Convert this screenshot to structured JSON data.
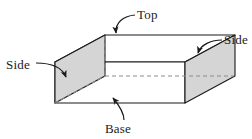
{
  "figure": {
    "shape": "rectangular prism (box)",
    "projection": "oblique",
    "colors": {
      "stroke": "#1a1a1a",
      "side_face_fill": "#d5d5d5",
      "front_face_fill": "#ffffff",
      "top_face_fill": "#ffffff",
      "hidden_edge": "#8c8c8c",
      "background": "#ffffff",
      "label_text": "#1a1a1a"
    },
    "labels": {
      "top": "Top",
      "side_left": "Side",
      "side_right": "Side",
      "base": "Base"
    },
    "annotations": [
      {
        "name": "top",
        "text": "Top",
        "points_to": "top face"
      },
      {
        "name": "side-left",
        "text": "Side",
        "points_to": "left side face"
      },
      {
        "name": "side-right",
        "text": "Side",
        "points_to": "right side face"
      },
      {
        "name": "base",
        "text": "Base",
        "points_to": "base face"
      }
    ],
    "geometry": {
      "front_bottom_left": [
        55,
        103
      ],
      "front_bottom_right": [
        185,
        103
      ],
      "front_top_left": [
        55,
        62
      ],
      "front_top_right": [
        185,
        62
      ],
      "back_bottom_left": [
        105,
        76
      ],
      "back_bottom_right": [
        235,
        76
      ],
      "back_top_left": [
        105,
        35
      ],
      "back_top_right": [
        235,
        35
      ],
      "hidden_edges": [
        "back_top_left-back_bottom_left",
        "back_bottom_left-back_bottom_right"
      ]
    }
  }
}
